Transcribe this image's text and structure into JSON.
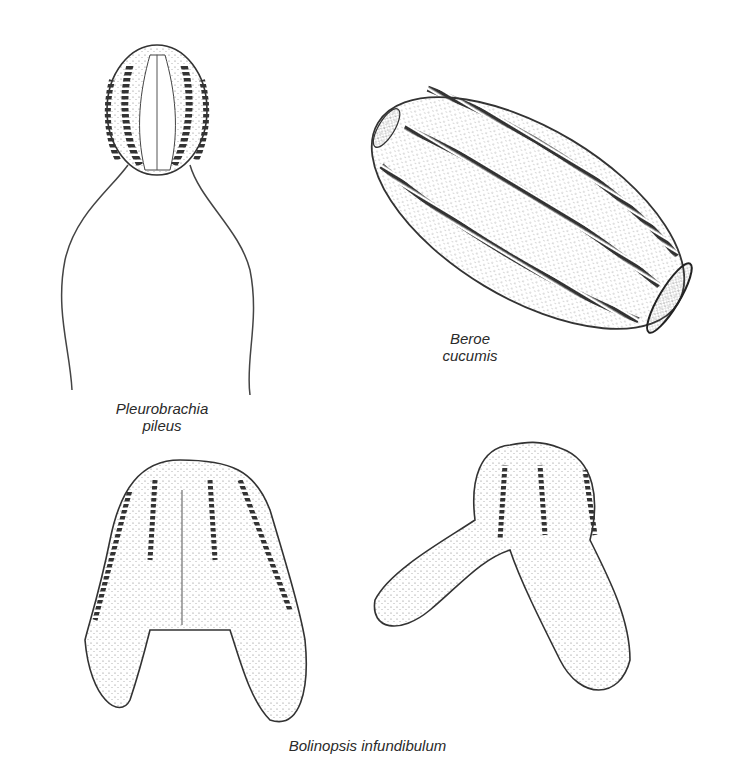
{
  "figure": {
    "specimens": [
      {
        "id": "pleurobrachia",
        "label_line1": "Pleurobrachia",
        "label_line2": "pileus"
      },
      {
        "id": "beroe",
        "label_line1": "Beroe",
        "label_line2": "cucumis"
      },
      {
        "id": "bolinopsis",
        "label_line1": "Bolinopsis infundibulum",
        "label_line2": ""
      }
    ],
    "colors": {
      "ink": "#2a2a2a",
      "stipple": "#6a6a6a",
      "background": "#ffffff"
    }
  }
}
